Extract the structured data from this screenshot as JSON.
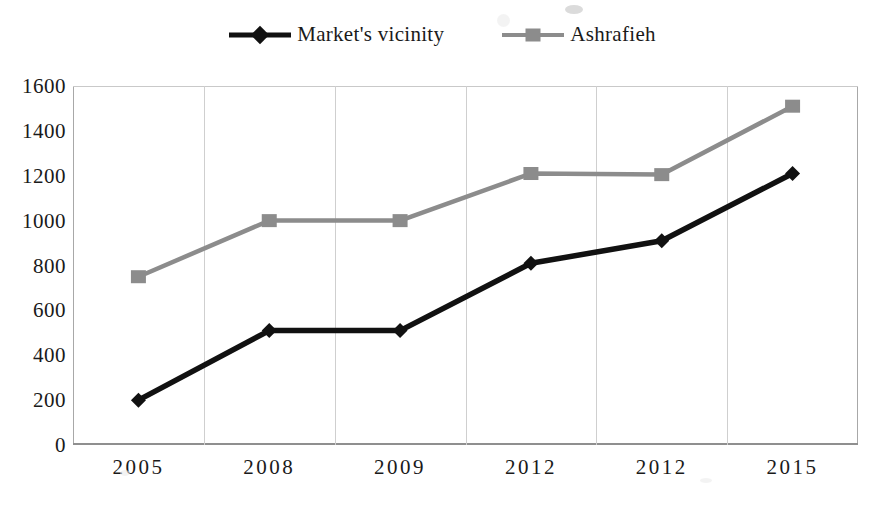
{
  "chart_data": {
    "type": "line",
    "title": "",
    "subtitle": "",
    "xlabel": "",
    "ylabel": "",
    "categories": [
      "2005",
      "2008",
      "2009",
      "2012",
      "2012",
      "2015"
    ],
    "series": [
      {
        "name": "Market's vicinity",
        "color": "#111111",
        "marker": "diamond",
        "values": [
          200,
          510,
          510,
          810,
          910,
          1210
        ]
      },
      {
        "name": "Ashrafieh",
        "color": "#8c8c8c",
        "marker": "square",
        "values": [
          750,
          1000,
          1000,
          1210,
          1205,
          1510
        ]
      }
    ],
    "ylim": [
      0,
      1600
    ],
    "ytick_step": 200,
    "yticks": [
      "0",
      "200",
      "400",
      "600",
      "800",
      "1000",
      "1200",
      "1400",
      "1600"
    ],
    "grid": {
      "vertical": true,
      "horizontal": false
    },
    "legend_position": "top-center"
  },
  "legend": {
    "entries": [
      {
        "label": "Market's vicinity",
        "icon": "diamond-marker-icon"
      },
      {
        "label": "Ashrafieh",
        "icon": "square-marker-icon"
      }
    ]
  },
  "colors": {
    "series_dark": "#111111",
    "series_gray": "#8c8c8c",
    "grid": "#cfcfcf",
    "axis": "#8f8f8f",
    "background": "#ffffff"
  }
}
